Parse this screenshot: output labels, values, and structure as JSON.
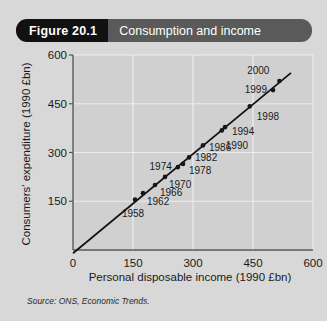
{
  "figure": {
    "number_label": "Figure 20.1",
    "title": "Consumption and income"
  },
  "source": {
    "prefix": "Source:",
    "text": "ONS, Economic Trends."
  },
  "colors": {
    "card_background": "#d8d8d8",
    "title_bar": "#5a5a5a",
    "title_number_block": "#111111",
    "plot_background": "#d0d0d0",
    "gridline": "#ededed",
    "axis": "#555555",
    "point": "#161616",
    "trend_line": "#111111",
    "text": "#1a1a1a"
  },
  "chart_data": {
    "type": "scatter",
    "title": "Consumption and income",
    "xlabel": "Personal disposable income (1990 £bn)",
    "ylabel": "Consumers' expenditure (1990 £bn)",
    "xlim": [
      0,
      600
    ],
    "ylim": [
      0,
      600
    ],
    "xticks": [
      0,
      150,
      300,
      450,
      600
    ],
    "yticks": [
      150,
      300,
      450,
      600
    ],
    "xtick_labels": [
      "0",
      "150",
      "300",
      "450",
      "600"
    ],
    "ytick_labels": [
      "150",
      "300",
      "450",
      "600"
    ],
    "grid": true,
    "legend": null,
    "point_label_field": "year",
    "points": [
      {
        "year": "1958",
        "x": 155,
        "y": 155,
        "label_dx": -2,
        "label_dy": 17,
        "label_anchor": "middle"
      },
      {
        "year": "1962",
        "x": 175,
        "y": 175,
        "label_dx": 4,
        "label_dy": 12,
        "label_anchor": "start"
      },
      {
        "year": "1966",
        "x": 205,
        "y": 200,
        "label_dx": 5,
        "label_dy": 11,
        "label_anchor": "start"
      },
      {
        "year": "1970",
        "x": 230,
        "y": 225,
        "label_dx": 4,
        "label_dy": 11,
        "label_anchor": "start"
      },
      {
        "year": "1974",
        "x": 262,
        "y": 255,
        "label_dx": -6,
        "label_dy": 3,
        "label_anchor": "end"
      },
      {
        "year": "1978",
        "x": 275,
        "y": 265,
        "label_dx": 6,
        "label_dy": 10,
        "label_anchor": "start"
      },
      {
        "year": "1982",
        "x": 290,
        "y": 285,
        "label_dx": 6,
        "label_dy": 4,
        "label_anchor": "start"
      },
      {
        "year": "1986",
        "x": 325,
        "y": 322,
        "label_dx": 6,
        "label_dy": 6,
        "label_anchor": "start"
      },
      {
        "year": "1990",
        "x": 372,
        "y": 368,
        "label_dx": 4,
        "label_dy": 19,
        "label_anchor": "start"
      },
      {
        "year": "1994",
        "x": 380,
        "y": 378,
        "label_dx": 7,
        "label_dy": 8,
        "label_anchor": "start"
      },
      {
        "year": "1998",
        "x": 442,
        "y": 442,
        "label_dx": 7,
        "label_dy": 14,
        "label_anchor": "start"
      },
      {
        "year": "1999",
        "x": 500,
        "y": 492,
        "label_dx": -6,
        "label_dy": 3,
        "label_anchor": "end"
      },
      {
        "year": "2000",
        "x": 516,
        "y": 520,
        "label_dx": -10,
        "label_dy": -7,
        "label_anchor": "end"
      }
    ],
    "trend_line": {
      "x0": 0,
      "y0": -10,
      "x1": 545,
      "y1": 545
    }
  }
}
